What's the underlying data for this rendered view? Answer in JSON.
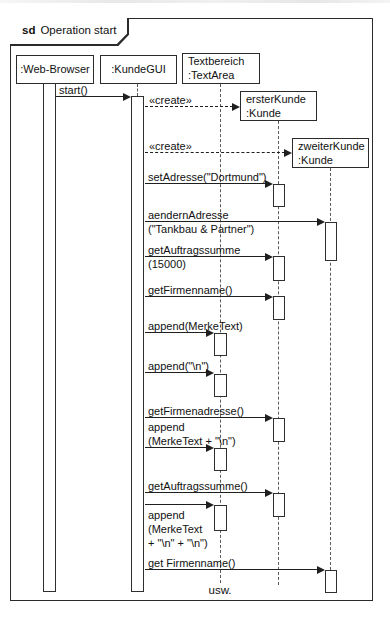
{
  "frame": {
    "keyword": "sd",
    "title": "Operation start"
  },
  "participants": [
    {
      "label": ":Web-Browser"
    },
    {
      "label": ":KundeGUI"
    },
    {
      "label": "Textbereich\n:TextArea"
    },
    {
      "label": "ersterKunde\n:Kunde"
    },
    {
      "label": "zweiterKunde\n:Kunde"
    }
  ],
  "messages": [
    {
      "label": "start()"
    },
    {
      "label": "«create»"
    },
    {
      "label": "«create»"
    },
    {
      "label": "setAdresse(\"Dortmund\")"
    },
    {
      "label": "aendernAdresse\n(\"Tankbau & Partner\")"
    },
    {
      "label": "getAuftragssumme\n(15000)"
    },
    {
      "label": "getFirmenname()"
    },
    {
      "label": "append(MerkeText)"
    },
    {
      "label": "append(\"\\n\")"
    },
    {
      "label": "getFirmenadresse()"
    },
    {
      "label": "append\n(MerkeText + \"\\n\")"
    },
    {
      "label": "getAuftragssumme()"
    },
    {
      "label": "append\n(MerkeText\n+ \"\\n\" + \"\\n\")"
    },
    {
      "label": "get Firmenname()"
    }
  ],
  "continuation": {
    "label": "usw."
  }
}
